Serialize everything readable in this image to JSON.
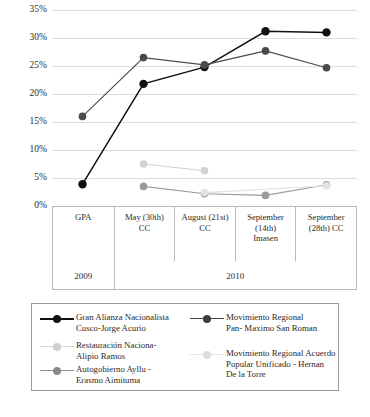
{
  "chart_data": {
    "type": "line",
    "title": "",
    "xlabel": "",
    "ylabel": "",
    "ylim": [
      0,
      35
    ],
    "ytick_labels": [
      "0%",
      "5%",
      "10%",
      "15%",
      "20%",
      "25%",
      "30%",
      "35%"
    ],
    "ytick_values": [
      0,
      5,
      10,
      15,
      20,
      25,
      30,
      35
    ],
    "grid": true,
    "legend_position": "bottom",
    "categories": [
      "GPA",
      "May (30th) CC",
      "August (21st) CC",
      "September (14th) Imasen",
      "September (28th) CC"
    ],
    "category_groups": [
      {
        "label": "2009",
        "span": 1
      },
      {
        "label": "2010",
        "span": 4
      }
    ],
    "series": [
      {
        "name": "Gran Alianza Nacionalista Cusco-Jorge Acurio",
        "color": "#111111",
        "values": [
          3.9,
          21.8,
          24.8,
          31.2,
          31.0
        ]
      },
      {
        "name": "Movimiento Regional Pan- Maximo San Roman",
        "color": "#4a4a4a",
        "values": [
          16.0,
          26.5,
          25.2,
          27.7,
          24.7
        ]
      },
      {
        "name": "Restauración Naciona- Alipio Ramos",
        "color": "#d2d2d2",
        "values": [
          null,
          7.5,
          6.3,
          null,
          null
        ]
      },
      {
        "name": "Autogobierno Ayllu - Erasmo Aimituma",
        "color": "#9a9a9a",
        "values": [
          null,
          3.5,
          2.2,
          1.9,
          3.8
        ]
      },
      {
        "name": "Movimiento Regional Acuerdo Popular Unificado - Hernan De la Torre",
        "color": "#e2e2e2",
        "values": [
          null,
          null,
          2.4,
          null,
          3.6
        ]
      }
    ]
  },
  "axis": {
    "ticks": [
      {
        "label": "35%",
        "value": 35
      },
      {
        "label": "30%",
        "value": 30
      },
      {
        "label": "25%",
        "value": 25
      },
      {
        "label": "20%",
        "value": 20
      },
      {
        "label": "15%",
        "value": 15
      },
      {
        "label": "10%",
        "value": 10
      },
      {
        "label": "5%",
        "value": 5
      },
      {
        "label": "0%",
        "value": 0
      }
    ]
  },
  "xaxis_table": {
    "events": [
      "GPA",
      "May (30th)\nCC",
      "August (21st)\nCC",
      "September\n(14th)\nImasen",
      "September\n(28th) CC"
    ],
    "years": [
      "2009",
      "2010"
    ]
  },
  "legend": {
    "left_items": [
      {
        "label": "Gran Alianza Nacionalista\nCusco-Jorge Acurio",
        "color": "#111111",
        "marker": "#111111"
      },
      {
        "label": "Restauración Naciona-\nAlipio Ramos",
        "color": "#d8d8d8",
        "marker": "#cfcfcf"
      },
      {
        "label": "Autogobierno Ayllu -\nErasmo Aimituma",
        "color": "#8f8f8f",
        "marker": "#8a8a8a"
      }
    ],
    "right_items": [
      {
        "label": "Movimiento Regional\nPan- Maximo San Roman",
        "color": "#444444",
        "marker": "#3d3d3d"
      },
      {
        "label": "Movimiento Regional Acuerdo\nPopular Unificado - Hernan\nDe la Torre",
        "color": "#e6e6e6",
        "marker": "#dcdcdc"
      }
    ]
  }
}
